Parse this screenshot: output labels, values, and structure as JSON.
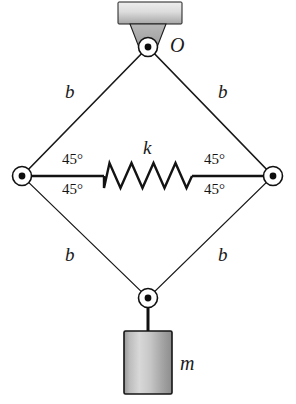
{
  "figure": {
    "background_color": "#ffffff",
    "width": 296,
    "height": 404
  },
  "colors": {
    "link_fill_light": "#dcdcdc",
    "link_fill_mid": "#b4b4b4",
    "link_fill_dark": "#8c8c8c",
    "outline": "#161616",
    "ceiling_light": "#e8e8e8",
    "ceiling_dark": "#a8a8a8",
    "joint_fill": "#ffffff",
    "joint_dot": "#0d0d0d",
    "mass_light": "#d2d2d2",
    "mass_dark": "#8a8a8a",
    "text": "#161616"
  },
  "support": {
    "ceiling_name": "ceiling-support-bar",
    "bracket_name": "pivot-bracket"
  },
  "labels": {
    "pivot_O": "O",
    "spring_k": "k",
    "mass_m": "m",
    "link_top_left": "b",
    "link_top_right": "b",
    "link_bottom_left": "b",
    "link_bottom_right": "b",
    "angle_left_upper": "45°",
    "angle_left_lower": "45°",
    "angle_right_upper": "45°",
    "angle_right_lower": "45°"
  },
  "joints": [
    {
      "name": "top-pivot-joint",
      "label": "O",
      "x": 148,
      "y": 47
    },
    {
      "name": "left-joint",
      "label": "",
      "x": 22,
      "y": 176
    },
    {
      "name": "right-joint",
      "label": "",
      "x": 273,
      "y": 176
    },
    {
      "name": "bottom-joint",
      "label": "",
      "x": 148,
      "y": 298
    }
  ],
  "links": [
    {
      "name": "link-top-left",
      "label": "b",
      "from": "top-pivot-joint",
      "to": "left-joint"
    },
    {
      "name": "link-top-right",
      "label": "b",
      "from": "top-pivot-joint",
      "to": "right-joint"
    },
    {
      "name": "link-bottom-left",
      "label": "b",
      "from": "left-joint",
      "to": "bottom-joint"
    },
    {
      "name": "link-bottom-right",
      "label": "b",
      "from": "right-joint",
      "to": "bottom-joint"
    }
  ],
  "spring": {
    "name": "spring-k",
    "label": "k",
    "coils": 8,
    "from": "left-joint",
    "to": "right-joint",
    "orientation": "horizontal"
  },
  "mass": {
    "name": "hanging-mass-block",
    "label": "m",
    "suspended_from": "bottom-joint"
  }
}
